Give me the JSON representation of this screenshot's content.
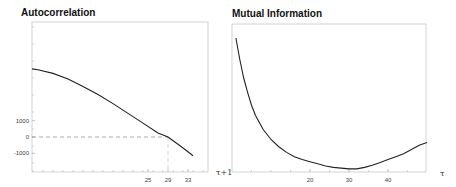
{
  "chart_data": [
    {
      "type": "line",
      "title": "Autocorrelation",
      "xlabel": "τ+1",
      "ylabel": "",
      "xlim": [
        0,
        36
      ],
      "ylim": [
        -2000,
        7000
      ],
      "grid": false,
      "xticks": [
        25,
        29,
        33
      ],
      "xtick_labels": [
        "25",
        "29",
        "33"
      ],
      "yticks": [
        1000,
        0,
        -1000
      ],
      "ytick_labels": [
        "1000",
        "0",
        "-1000"
      ],
      "series": [
        {
          "name": "autocorrelation",
          "x": [
            0,
            3,
            6,
            9,
            12,
            15,
            18,
            21,
            24,
            27,
            29,
            31,
            33,
            34
          ],
          "y": [
            4180,
            4120,
            3900,
            3550,
            3100,
            2600,
            2050,
            1450,
            850,
            250,
            0,
            -450,
            -900,
            -1150
          ]
        }
      ],
      "annotations": [
        {
          "type": "reference-line",
          "orientation": "horizontal",
          "y": 0,
          "x_end": 29,
          "style": "dashed"
        },
        {
          "type": "reference-line",
          "orientation": "vertical",
          "x": 29,
          "y_end": 0,
          "style": "dashed"
        }
      ]
    },
    {
      "type": "line",
      "title": "Mutual Information",
      "xlabel": "τ",
      "ylabel": "",
      "xlim": [
        0,
        50
      ],
      "ylim": [
        0,
        1
      ],
      "grid": false,
      "xticks": [
        20,
        30,
        40
      ],
      "xtick_labels": [
        "20",
        "30",
        "40"
      ],
      "series": [
        {
          "name": "mutual-information",
          "x": [
            1,
            2,
            3,
            4,
            5,
            6,
            8,
            10,
            12,
            14,
            16,
            18,
            20,
            22,
            24,
            26,
            28,
            30,
            32,
            34,
            36,
            38,
            40,
            42,
            44,
            46,
            48,
            50
          ],
          "y": [
            0.93,
            0.78,
            0.65,
            0.55,
            0.46,
            0.39,
            0.29,
            0.22,
            0.17,
            0.13,
            0.1,
            0.08,
            0.065,
            0.05,
            0.035,
            0.025,
            0.02,
            0.015,
            0.015,
            0.025,
            0.04,
            0.06,
            0.08,
            0.1,
            0.12,
            0.15,
            0.18,
            0.2
          ]
        }
      ],
      "annotations": []
    }
  ]
}
